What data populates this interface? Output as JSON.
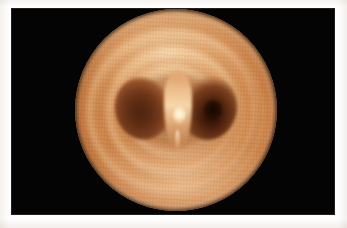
{
  "figure": {
    "kind": "medical-photograph",
    "modality": "bronchoscopy",
    "title": "",
    "caption": "",
    "plate": {
      "background_color": "#ffffff",
      "frame_color": "#050405",
      "frame_left": 11,
      "frame_top": 8,
      "frame_width": 324,
      "frame_height": 207
    },
    "field_of_view": {
      "shape": "circle",
      "center_x": 176,
      "center_y": 110,
      "radius": 101
    },
    "colors": {
      "mucosa_light": "#e6b383",
      "mucosa_mid": "#d1894f",
      "mucosa_rim": "#a95f2e",
      "lumen_left": "#50240f",
      "lumen_right": "#2b0f04",
      "carina_highlight": "#fff8e6",
      "background": "#050405"
    },
    "structures": [
      {
        "name": "tracheal-mucosa",
        "label": "Tracheal mucosa"
      },
      {
        "name": "tracheal-rings",
        "label": "Cartilaginous ring ridges"
      },
      {
        "name": "carina",
        "label": "Carina"
      },
      {
        "name": "right-main-bronchus-orifice",
        "label": "Right main bronchus orifice"
      },
      {
        "name": "left-main-bronchus-orifice",
        "label": "Left main bronchus orifice"
      },
      {
        "name": "specular-highlight",
        "label": "Light reflection"
      }
    ]
  }
}
